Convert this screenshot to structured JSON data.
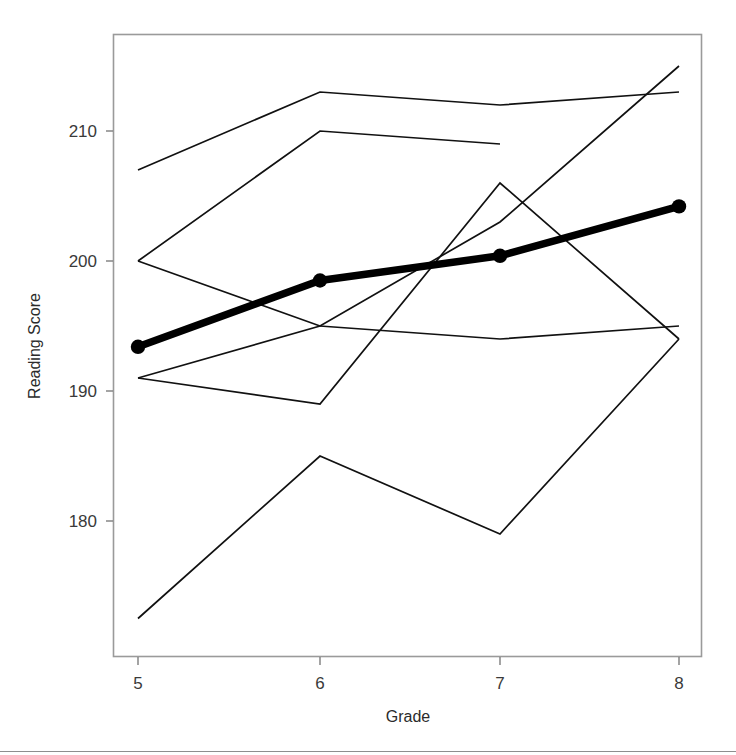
{
  "figure": {
    "background": "#ffffff",
    "line_color": "#111111",
    "mean_line_color": "#000000",
    "frame_color": "#9a9a9a"
  },
  "chart_data": {
    "type": "line",
    "title": "",
    "subtitle": "",
    "xlabel": "Grade",
    "ylabel": "Reading Score",
    "x": [
      5,
      6,
      7,
      8
    ],
    "xtick_labels": [
      "5",
      "6",
      "7",
      "8"
    ],
    "ytick_labels": [
      "180",
      "190",
      "200",
      "210"
    ],
    "yticks": [
      180,
      190,
      200,
      210
    ],
    "xlim": [
      4.62,
      8.13
    ],
    "ylim": [
      171.7,
      219.6
    ],
    "grid": false,
    "legend": "none",
    "series": [
      {
        "name": "School A",
        "values": [
          207,
          213,
          212,
          213
        ],
        "style": "thin"
      },
      {
        "name": "School B",
        "values": [
          200,
          210,
          209,
          null
        ],
        "style": "thin"
      },
      {
        "name": "School C",
        "values": [
          200,
          195,
          194,
          195
        ],
        "style": "thin"
      },
      {
        "name": "School D",
        "values": [
          191,
          189,
          206,
          194
        ],
        "style": "thin"
      },
      {
        "name": "School E",
        "values": [
          191,
          195,
          203,
          215
        ],
        "style": "thin"
      },
      {
        "name": "School F",
        "values": [
          172.5,
          185,
          179,
          194
        ],
        "style": "thin"
      },
      {
        "name": "Mean",
        "values": [
          193.4,
          198.5,
          200.4,
          204.2
        ],
        "style": "thick-markers"
      }
    ]
  }
}
